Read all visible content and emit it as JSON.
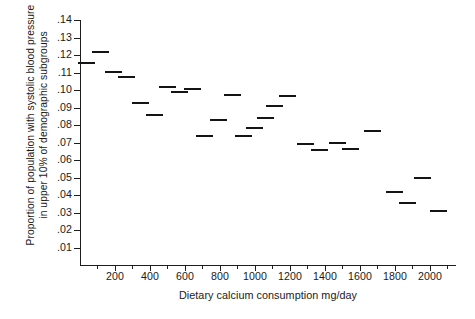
{
  "chart_data": {
    "type": "scatter",
    "title": "",
    "xlabel": "Dietary calcium consumption mg/day",
    "ylabel_lines": [
      "Proportion of population with systolic blood pressure",
      "in upper 10% of demographic subgroups"
    ],
    "ylabel": "Proportion of population with systolic blood pressure in upper 10% of demographic subgroups",
    "xlim": [
      0,
      2150
    ],
    "ylim": [
      0,
      0.145
    ],
    "grid": false,
    "legend": null,
    "marker_style": "horizontal-dash",
    "xticks": [
      200,
      400,
      600,
      800,
      1000,
      1200,
      1400,
      1600,
      1800,
      2000
    ],
    "xtick_labels": [
      "200",
      "400",
      "600",
      "800",
      "1000",
      "1200",
      "1400",
      "1600",
      "1800",
      "2000"
    ],
    "x_minor_ticks": [
      100,
      300,
      500,
      700,
      900,
      1100,
      1300,
      1500,
      1700,
      1900,
      2100
    ],
    "yticks": [
      0.01,
      0.02,
      0.03,
      0.04,
      0.05,
      0.06,
      0.07,
      0.08,
      0.09,
      0.1,
      0.11,
      0.12,
      0.13,
      0.14
    ],
    "ytick_labels": [
      ".01",
      ".02",
      ".03",
      ".04",
      ".05",
      ".06",
      ".07",
      ".08",
      ".09",
      ".10",
      ".11",
      ".12",
      ".13",
      ".14"
    ],
    "points": [
      {
        "x": 35,
        "y": 0.1155
      },
      {
        "x": 115,
        "y": 0.1215
      },
      {
        "x": 190,
        "y": 0.1105
      },
      {
        "x": 265,
        "y": 0.1075
      },
      {
        "x": 345,
        "y": 0.0925
      },
      {
        "x": 425,
        "y": 0.0855
      },
      {
        "x": 500,
        "y": 0.1015
      },
      {
        "x": 570,
        "y": 0.099
      },
      {
        "x": 645,
        "y": 0.1005
      },
      {
        "x": 710,
        "y": 0.0735
      },
      {
        "x": 790,
        "y": 0.083
      },
      {
        "x": 870,
        "y": 0.097
      },
      {
        "x": 935,
        "y": 0.0735
      },
      {
        "x": 1000,
        "y": 0.0785
      },
      {
        "x": 1060,
        "y": 0.084
      },
      {
        "x": 1115,
        "y": 0.091
      },
      {
        "x": 1185,
        "y": 0.0965
      },
      {
        "x": 1290,
        "y": 0.069
      },
      {
        "x": 1370,
        "y": 0.0655
      },
      {
        "x": 1475,
        "y": 0.07
      },
      {
        "x": 1545,
        "y": 0.0665
      },
      {
        "x": 1670,
        "y": 0.0765
      },
      {
        "x": 1800,
        "y": 0.0415
      },
      {
        "x": 1875,
        "y": 0.0355
      },
      {
        "x": 1960,
        "y": 0.05
      },
      {
        "x": 2050,
        "y": 0.031
      }
    ]
  },
  "axes": {
    "x_axis_name": "x-axis",
    "y_axis_name": "y-axis"
  }
}
